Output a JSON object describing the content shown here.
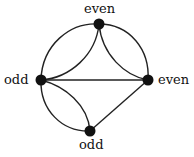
{
  "diagram": {
    "type": "multigraph",
    "nodes": [
      {
        "id": "top",
        "label": "even",
        "x": 99,
        "y": 24
      },
      {
        "id": "left",
        "label": "odd",
        "x": 41,
        "y": 80
      },
      {
        "id": "right",
        "label": "even",
        "x": 148,
        "y": 80
      },
      {
        "id": "bottom",
        "label": "odd",
        "x": 90,
        "y": 131
      }
    ],
    "edges": [
      {
        "from": "top",
        "to": "left",
        "count": 2
      },
      {
        "from": "top",
        "to": "right",
        "count": 2
      },
      {
        "from": "left",
        "to": "right",
        "count": 1
      },
      {
        "from": "left",
        "to": "bottom",
        "count": 2
      },
      {
        "from": "right",
        "to": "bottom",
        "count": 1
      }
    ],
    "colors": {
      "node": "#111111",
      "edge": "#222222",
      "background": "#ffffff"
    }
  }
}
